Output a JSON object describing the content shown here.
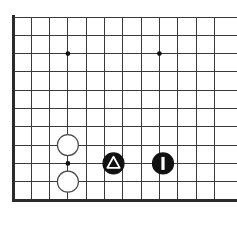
{
  "figure": {
    "kind": "go-board-diagram",
    "title": "",
    "width": 237,
    "height": 229,
    "background_color": "#ffffff"
  },
  "board": {
    "origin_x": 13,
    "origin_y": 17,
    "cell_size": 18.3,
    "vertical_lines": 12,
    "horizontal_lines": 11,
    "line_color": "#3a3a3a",
    "line_width": 1,
    "edge_color": "#2b2b2b",
    "edge_width": 3,
    "edges": [
      "left",
      "bottom"
    ],
    "clipped_edges": [
      "top",
      "right"
    ],
    "star_point_color": "#111111",
    "star_point_radius": 2.4,
    "star_points": [
      {
        "col": 3,
        "row": 2,
        "cx": 67.9,
        "cy": 53.6
      },
      {
        "col": 8,
        "row": 2,
        "cx": 159.4,
        "cy": 53.6
      },
      {
        "col": 3,
        "row": 8,
        "cx": 67.9,
        "cy": 163.4
      }
    ]
  },
  "stones": [
    {
      "id": "white-stone-upper",
      "color": "white",
      "label": "",
      "marker": "none",
      "col": 3,
      "row": 7,
      "cx": 67.9,
      "cy": 145.1,
      "radius": 10.5,
      "fill": "#ffffff",
      "stroke": "#4a4a4a"
    },
    {
      "id": "white-stone-lower",
      "color": "white",
      "label": "",
      "marker": "none",
      "col": 3,
      "row": 9,
      "cx": 67.9,
      "cy": 181.7,
      "radius": 10.5,
      "fill": "#ffffff",
      "stroke": "#4a4a4a"
    },
    {
      "id": "black-stone-triangle",
      "color": "black",
      "label": "",
      "marker": "triangle",
      "marker_color": "#ffffff",
      "col": 5.5,
      "row": 8,
      "cx": 113.5,
      "cy": 163.4,
      "radius": 10.5,
      "fill": "#111111",
      "stroke": "#111111"
    },
    {
      "id": "black-stone-one",
      "color": "black",
      "label": "1",
      "marker": "bar",
      "marker_color": "#ffffff",
      "col": 8,
      "row": 8,
      "cx": 163.0,
      "cy": 163.4,
      "radius": 10.5,
      "fill": "#111111",
      "stroke": "#111111"
    }
  ],
  "legend": {
    "black_label": "Black",
    "white_label": "White",
    "triangle_label": "marked stone",
    "move_number_label": "1"
  }
}
